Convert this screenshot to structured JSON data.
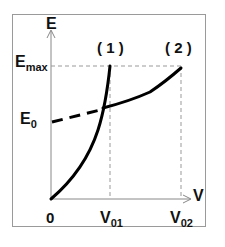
{
  "diagram": {
    "axes": {
      "y_label": "E",
      "x_label": "V",
      "origin_label": "0"
    },
    "y_ticks": [
      {
        "base": "E",
        "sub": "max"
      },
      {
        "base": "E",
        "sub": "0"
      }
    ],
    "x_ticks": [
      {
        "base": "V",
        "sub": "01"
      },
      {
        "base": "V",
        "sub": "02"
      }
    ],
    "curves": [
      {
        "label": "( 1 )",
        "description": "steep convex curve from origin to (V01, Emax)"
      },
      {
        "label": "( 2 )",
        "description": "curve starting at E0 (dashed part) rising gently to (V02, Emax)"
      }
    ],
    "colors": {
      "curve": "#000000",
      "axis": "#888888",
      "guide_dashed": "#999999",
      "frame": "#9a9a9a"
    }
  }
}
